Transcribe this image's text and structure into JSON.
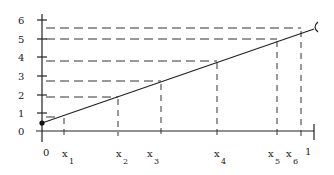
{
  "diagram": {
    "y_tick_labels": [
      "0",
      "1",
      "2",
      "3",
      "4",
      "5",
      "6"
    ],
    "x_labels": [
      {
        "base": "0",
        "sub": ""
      },
      {
        "base": "x",
        "sub": "1"
      },
      {
        "base": "x",
        "sub": "2"
      },
      {
        "base": "x",
        "sub": "3"
      },
      {
        "base": "x",
        "sub": "4"
      },
      {
        "base": "x",
        "sub": "5"
      },
      {
        "base": "x",
        "sub": "6"
      },
      {
        "base": "1",
        "sub": ""
      }
    ],
    "line": {
      "from": "filled dot at origin (0, ~0.4)",
      "to": "open endpoint at x=1 (~5.7)"
    },
    "stroke_color": "#222222"
  }
}
